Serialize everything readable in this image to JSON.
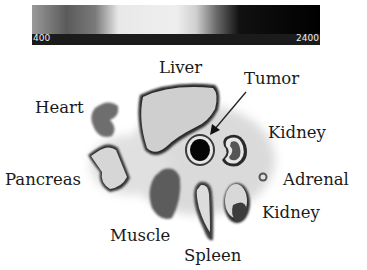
{
  "colorbar": {
    "min_label": "400",
    "max_label": "2400"
  },
  "labels": {
    "liver": "Liver",
    "tumor": "Tumor",
    "heart": "Heart",
    "kidney_upper": "Kidney",
    "pancreas": "Pancreas",
    "adrenal": "Adrenal",
    "kidney_lower": "Kidney",
    "muscle": "Muscle",
    "spleen": "Spleen"
  }
}
